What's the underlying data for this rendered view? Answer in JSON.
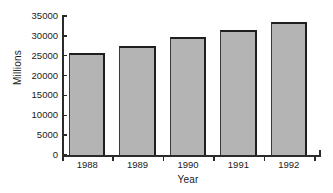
{
  "chart_data": {
    "type": "bar",
    "title": "",
    "xlabel": "Year",
    "ylabel": "Millions",
    "categories": [
      "1988",
      "1989",
      "1990",
      "1991",
      "1992"
    ],
    "values": [
      25600,
      27400,
      29600,
      31600,
      33400
    ],
    "ylim": [
      0,
      35000
    ],
    "yticks": [
      0,
      5000,
      10000,
      15000,
      20000,
      25000,
      30000,
      35000
    ],
    "ytick_labels": [
      "0",
      "5000",
      "10000",
      "15000",
      "20000",
      "25000",
      "30000",
      "35000"
    ],
    "grid": false,
    "legend": null,
    "series": [
      {
        "name": "Millions",
        "values": [
          25600,
          27400,
          29600,
          31600,
          33400
        ]
      }
    ],
    "colors": {
      "bar_fill": "#b4b4b4",
      "bar_edge": "#1f1f1f",
      "axis": "#2b2b2b",
      "text": "#1a1a1a",
      "background": "#ffffff"
    }
  }
}
